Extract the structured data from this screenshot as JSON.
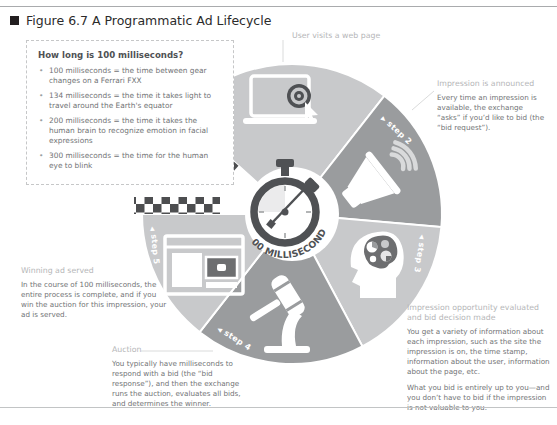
{
  "figure": {
    "title": "Figure 6.7  A Programmatic Ad Lifecycle"
  },
  "info_box": {
    "title": "How long is 100 milliseconds?",
    "bullets": [
      "100 milliseconds = the time between gear changes on a Ferrari FXX",
      "134 milliseconds = the time it takes light to travel around the Earth's equator",
      "200 milliseconds = the time it takes the human brain to recognize emotion in facial expressions",
      "300 milliseconds = the time for the human eye to blink"
    ]
  },
  "wheel": {
    "center_label": "100 MILLISECONDS",
    "steps": [
      {
        "arrow": "▶",
        "label": "step 1",
        "icon": "laptop-click-icon"
      },
      {
        "arrow": "▶",
        "label": "step 2",
        "icon": "megaphone-icon"
      },
      {
        "arrow": "◀",
        "label": "step 3",
        "icon": "head-gears-icon"
      },
      {
        "arrow": "◀",
        "label": "step 4",
        "icon": "gavel-icon"
      },
      {
        "arrow": "◀",
        "label": "step 5",
        "icon": "browser-ad-icon"
      }
    ],
    "colors": {
      "light_wedge": "#c8c9cb",
      "dark_wedge": "#9a9c9e",
      "checker": "#4d4e50",
      "stopwatch": "#4f5154",
      "icon": "#ffffff"
    }
  },
  "annotations": {
    "visit": {
      "heading": "User visits a web page"
    },
    "announce": {
      "heading": "Impression is announced",
      "body": "Every time an impression is available, the exchange “asks” if you’d like to bid (the “bid request”)."
    },
    "evaluate": {
      "heading": "Impression opportunity evaluated and bid decision made",
      "body1": "You get a variety of information about each impression, such as the site the impression is on, the time stamp, information about the user, information about the page, etc.",
      "body2": "What you bid is entirely up to you—and you don’t have to bid if the impression is not valuable to you."
    },
    "auction": {
      "heading": "Auction",
      "body": "You typically have milliseconds to respond with a bid (the “bid response”), and then the exchange runs the auction, evaluates all bids, and determines the winner."
    },
    "serve": {
      "heading": "Winning ad served",
      "body": "In the course of 100 milliseconds, the entire process is complete, and if you win the auction for this impression, your ad is served."
    }
  }
}
